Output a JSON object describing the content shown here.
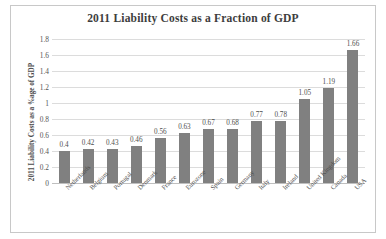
{
  "chart_data": {
    "type": "bar",
    "title": "2011 Liability Costs as a Fraction of GDP",
    "xlabel": "",
    "ylabel": "2011 Liability Costs as a %age of GDP",
    "categories": [
      "Netherlands",
      "Belgium",
      "Portugal",
      "Denmark",
      "France",
      "Eurozone",
      "Spain",
      "Germany",
      "Italy",
      "Ireland",
      "United Kingdom",
      "Canada",
      "USA"
    ],
    "values": [
      0.4,
      0.42,
      0.43,
      0.46,
      0.56,
      0.63,
      0.67,
      0.68,
      0.77,
      0.78,
      1.05,
      1.19,
      1.66
    ],
    "value_labels": [
      "0.4",
      "0.42",
      "0.43",
      "0.46",
      "0.56",
      "0.63",
      "0.67",
      "0.68",
      "0.77",
      "0.78",
      "1.05",
      "1.19",
      "1.66"
    ],
    "ylim": [
      0,
      1.8
    ],
    "yticks": [
      0,
      0.2,
      0.4,
      0.6,
      0.8,
      1,
      1.2,
      1.4,
      1.6,
      1.8
    ],
    "ytick_labels": [
      "0",
      "0.2",
      "0.4",
      "0.6",
      "0.8",
      "1",
      "1.2",
      "1.4",
      "1.6",
      "1.8"
    ],
    "grid": true,
    "legend": false,
    "bar_color": "#808080",
    "gridline_color": "#dcdcdc",
    "text_color": "#4f4f4f",
    "border_color": "#c8c8c8",
    "background": "#ffffff"
  }
}
